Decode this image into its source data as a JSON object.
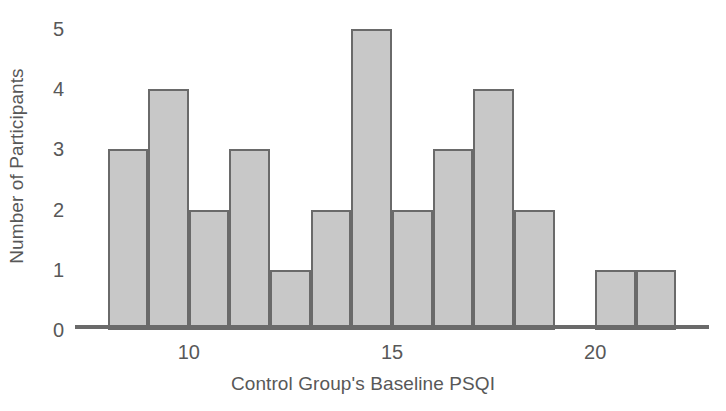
{
  "chart_data": {
    "type": "bar",
    "title": "",
    "xlabel": "Control Group's Baseline PSQI",
    "ylabel": "Number of Participants",
    "xlim": [
      7.2,
      22.8
    ],
    "ylim": [
      0,
      5.2
    ],
    "xticks": [
      10,
      15,
      20
    ],
    "xtick_labels": [
      "10",
      "15",
      "20"
    ],
    "yticks": [
      0,
      1,
      2,
      3,
      4,
      5
    ],
    "ytick_labels": [
      "0",
      "1",
      "2",
      "3",
      "4",
      "5"
    ],
    "grid": false,
    "legend": null,
    "bin_width": 1,
    "bins": [
      {
        "left": 8,
        "right": 9,
        "value": 3
      },
      {
        "left": 9,
        "right": 10,
        "value": 4
      },
      {
        "left": 10,
        "right": 11,
        "value": 2
      },
      {
        "left": 11,
        "right": 12,
        "value": 3
      },
      {
        "left": 12,
        "right": 13,
        "value": 1
      },
      {
        "left": 13,
        "right": 14,
        "value": 2
      },
      {
        "left": 14,
        "right": 15,
        "value": 5
      },
      {
        "left": 15,
        "right": 16,
        "value": 2
      },
      {
        "left": 16,
        "right": 17,
        "value": 3
      },
      {
        "left": 17,
        "right": 18,
        "value": 4
      },
      {
        "left": 18,
        "right": 19,
        "value": 2
      },
      {
        "left": 20,
        "right": 21,
        "value": 1
      },
      {
        "left": 21,
        "right": 22,
        "value": 1
      }
    ],
    "categories": [
      "8-9",
      "9-10",
      "10-11",
      "11-12",
      "12-13",
      "13-14",
      "14-15",
      "15-16",
      "16-17",
      "17-18",
      "18-19",
      "20-21",
      "21-22"
    ],
    "values": [
      3,
      4,
      2,
      3,
      1,
      2,
      5,
      2,
      3,
      4,
      2,
      1,
      1
    ],
    "total_participants": 33,
    "colors": {
      "bar_fill": "#c8c8c8",
      "bar_border": "#6a6a6a",
      "axis": "#6a6a6a",
      "text": "#585858",
      "background": "#ffffff"
    }
  }
}
